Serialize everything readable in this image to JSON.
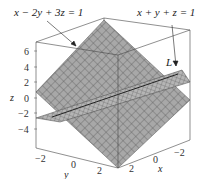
{
  "figure": {
    "labels": {
      "plane1": "x − 2y + 3z = 1",
      "plane2": "x + y + z = 1",
      "line": "L"
    },
    "axes": {
      "z": {
        "label": "z",
        "ticks": [
          "6",
          "4",
          "2",
          "0",
          "−2",
          "−4"
        ]
      },
      "y": {
        "label": "y",
        "ticks": [
          "−2",
          "0",
          "2"
        ]
      },
      "x": {
        "label": "x",
        "ticks": [
          "−2",
          "0",
          "2"
        ]
      }
    },
    "colors": {
      "plane_fill": "#9a9a9a",
      "plane_grid": "#5a5a5a",
      "box": "#444444"
    }
  }
}
